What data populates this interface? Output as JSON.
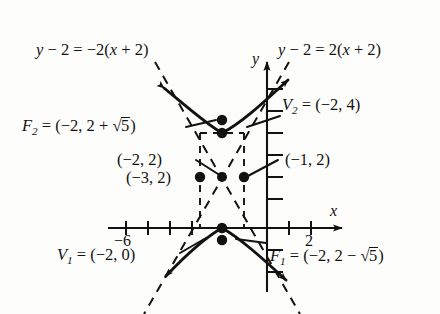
{
  "figure": {
    "type": "hyperbola-graph",
    "colors": {
      "ink": "#121212",
      "paper": "#fdfdfb"
    }
  },
  "axes": {
    "x_axis_label": "x",
    "y_axis_label": "y",
    "x_ticks": [
      {
        "value": -8,
        "label": ""
      },
      {
        "value": -7,
        "label": ""
      },
      {
        "value": -6,
        "label": "-6"
      },
      {
        "value": -5,
        "label": ""
      },
      {
        "value": -4,
        "label": ""
      },
      {
        "value": -3,
        "label": ""
      },
      {
        "value": 1,
        "label": ""
      },
      {
        "value": 2,
        "label": "2"
      },
      {
        "value": 3,
        "label": ""
      }
    ],
    "x_tick_label_minus6": "−6",
    "x_tick_label_2": "2",
    "y_ticks_visible": true
  },
  "asymptotes": {
    "left": "y − 2 = −2(x + 2)",
    "right": "y − 2 = 2(x + 2)"
  },
  "points": {
    "focus_upper": {
      "name": "F2",
      "label_prefix": "F",
      "label_sub": "2",
      "label_body": " = (−2, 2 + ",
      "label_radicand": "5",
      "label_suffix": ")",
      "coords": "(-2, 2 + sqrt5)"
    },
    "focus_lower": {
      "name": "F1",
      "label_prefix": "F",
      "label_sub": "1",
      "label_body": " = (−2, 2 − ",
      "label_radicand": "5",
      "label_suffix": ")",
      "coords": "(-2, 2 - sqrt5)"
    },
    "vertex_upper": {
      "name": "V2",
      "label_prefix": "V",
      "label_sub": "2",
      "label_body": " = (−2, 4)",
      "coords": "(-2, 4)"
    },
    "vertex_lower": {
      "name": "V1",
      "label_prefix": "V",
      "label_sub": "1",
      "label_body": " = (−2, 0)",
      "coords": "(-2, 0)"
    },
    "center": {
      "name": "center",
      "label": "(−2, 2)",
      "coords": "(-2, 2)"
    },
    "left_corner": {
      "name": "left-box-point",
      "label": "(−3, 2)",
      "coords": "(-3, 2)"
    },
    "right_corner": {
      "name": "right-box-point",
      "label": "(−1, 2)",
      "coords": "(-1, 2)"
    }
  }
}
